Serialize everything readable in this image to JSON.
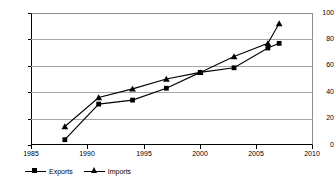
{
  "chart_data": {
    "type": "line",
    "title": "",
    "subtitle": "",
    "xlabel": "",
    "ylabel": "",
    "xlim": [
      1985,
      2010
    ],
    "ylim": [
      0,
      100
    ],
    "grid": true,
    "legend_position": "bottom-left",
    "x_ticks": [
      1985,
      1990,
      1995,
      2000,
      2005,
      2010
    ],
    "y_ticks": [
      0,
      20,
      40,
      60,
      80,
      100
    ],
    "x_tick_labels": [
      "1985",
      "1990",
      "1995",
      "2000",
      "2005",
      "2010"
    ],
    "y_tick_labels": [
      "0",
      "20",
      "40",
      "60",
      "80",
      "100"
    ],
    "series": [
      {
        "name": "Exports",
        "marker": "square",
        "color": "#000000",
        "x": [
          1988,
          1991,
          1994,
          1997,
          2000,
          2003,
          2006,
          2007
        ],
        "values": [
          4,
          31,
          34,
          43,
          55,
          58.5,
          73.5,
          77
        ]
      },
      {
        "name": "Imports",
        "marker": "triangle",
        "color": "#000000",
        "x": [
          1988,
          1991,
          1994,
          1997,
          2000,
          2003,
          2006,
          2007
        ],
        "values": [
          14,
          36,
          42.5,
          50,
          55,
          67,
          77,
          92
        ]
      }
    ]
  },
  "legend": {
    "items": [
      {
        "label": "Exports",
        "marker": "square"
      },
      {
        "label": "Imports",
        "marker": "triangle"
      }
    ]
  }
}
